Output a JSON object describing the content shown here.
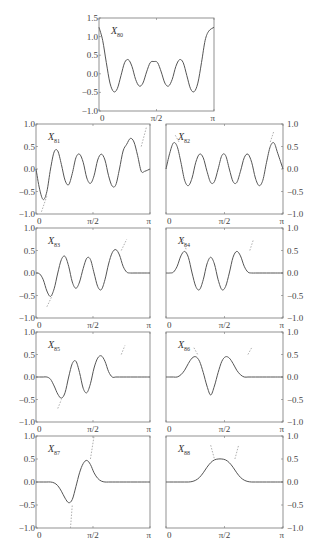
{
  "chart_data": [
    {
      "type": "line",
      "title": "X80",
      "label": "X",
      "subscript": "80",
      "xlim": [
        0,
        3.1416
      ],
      "ylim": [
        -1.0,
        1.5
      ],
      "xticks": [
        "0",
        "π/2",
        "π"
      ],
      "yticks": [
        "-1.0",
        "-0.5",
        "0.0",
        "0.5",
        "1.0",
        "1.5"
      ],
      "ytick_side": "left",
      "box": [
        99,
        18,
        214,
        111
      ],
      "x": [
        0,
        0.1,
        0.2,
        0.3,
        0.4,
        0.5,
        0.6,
        0.7,
        0.8,
        0.9,
        1.0,
        1.1,
        1.2,
        1.3,
        1.4,
        1.5,
        1.6,
        1.7,
        1.8,
        1.9,
        2.0,
        2.1,
        2.2,
        2.3,
        2.4,
        2.5,
        2.6,
        2.7,
        2.8,
        2.9,
        3.0,
        3.1416
      ],
      "solid": [
        1.25,
        0.9,
        0.3,
        -0.25,
        -0.48,
        -0.4,
        -0.05,
        0.3,
        0.38,
        0.2,
        -0.15,
        -0.33,
        -0.25,
        0.05,
        0.3,
        0.33,
        0.3,
        0.05,
        -0.25,
        -0.33,
        -0.15,
        0.2,
        0.38,
        0.3,
        -0.05,
        -0.4,
        -0.48,
        -0.25,
        0.3,
        0.9,
        1.15,
        1.25
      ],
      "dashed": []
    },
    {
      "type": "line",
      "title": "X81",
      "label": "X",
      "subscript": "81",
      "xlim": [
        0,
        3.1416
      ],
      "ylim": [
        -1.0,
        1.0
      ],
      "xticks": [
        "0",
        "π/2",
        "π"
      ],
      "yticks": [
        "-1.0",
        "-0.5",
        "0.0",
        "0.5",
        "1.0"
      ],
      "ytick_side": "left",
      "box": [
        36,
        124,
        150,
        214
      ],
      "x": [
        0,
        0.1,
        0.2,
        0.3,
        0.4,
        0.5,
        0.6,
        0.7,
        0.8,
        0.9,
        1.0,
        1.1,
        1.2,
        1.3,
        1.4,
        1.5,
        1.6,
        1.7,
        1.8,
        1.9,
        2.0,
        2.1,
        2.2,
        2.3,
        2.4,
        2.5,
        2.6,
        2.7,
        2.8,
        2.9,
        3.0,
        3.1416
      ],
      "solid": [
        0.0,
        -0.45,
        -0.68,
        -0.5,
        0.0,
        0.38,
        0.4,
        0.1,
        -0.25,
        -0.35,
        -0.1,
        0.25,
        0.33,
        0.15,
        -0.2,
        -0.32,
        -0.15,
        0.2,
        0.33,
        0.2,
        -0.15,
        -0.38,
        -0.35,
        0.0,
        0.4,
        0.55,
        0.68,
        0.6,
        0.3,
        -0.05,
        -0.05,
        0.0
      ],
      "dashed_points": [
        [
          0.15,
          -0.95
        ],
        [
          0.3,
          -0.6
        ]
      ],
      "dashed_points_right": [
        [
          2.9,
          0.5
        ],
        [
          3.05,
          0.95
        ]
      ]
    },
    {
      "type": "line",
      "title": "X82",
      "label": "X",
      "subscript": "82",
      "xlim": [
        0,
        3.1416
      ],
      "ylim": [
        -1.0,
        1.0
      ],
      "xticks": [
        "0",
        "π/2",
        "π"
      ],
      "yticks": [
        "-1.0",
        "-0.5",
        "0.0",
        "0.5",
        "1.0"
      ],
      "ytick_side": "right",
      "box": [
        166,
        124,
        283,
        214
      ],
      "x": [
        0,
        0.1,
        0.2,
        0.3,
        0.4,
        0.5,
        0.6,
        0.7,
        0.8,
        0.9,
        1.0,
        1.1,
        1.2,
        1.3,
        1.4,
        1.5,
        1.6,
        1.7,
        1.8,
        1.9,
        2.0,
        2.1,
        2.2,
        2.3,
        2.4,
        2.5,
        2.6,
        2.7,
        2.8,
        2.9,
        3.0,
        3.1416
      ],
      "solid": [
        0.0,
        0.35,
        0.58,
        0.5,
        0.15,
        -0.25,
        -0.37,
        -0.2,
        0.15,
        0.33,
        0.25,
        -0.05,
        -0.3,
        -0.28,
        0.0,
        0.3,
        0.3,
        0.0,
        -0.28,
        -0.3,
        -0.05,
        0.25,
        0.33,
        0.15,
        -0.2,
        -0.37,
        -0.25,
        0.15,
        0.5,
        0.58,
        0.35,
        0.0
      ],
      "dashed_points": [
        [
          0.25,
          0.75
        ],
        [
          0.35,
          0.6
        ]
      ],
      "dashed_points_right": [
        [
          2.8,
          0.6
        ],
        [
          2.9,
          0.85
        ]
      ]
    },
    {
      "type": "line",
      "title": "X83",
      "label": "X",
      "subscript": "83",
      "xlim": [
        0,
        3.1416
      ],
      "ylim": [
        -1.0,
        1.0
      ],
      "xticks": [
        "0",
        "π/2",
        "π"
      ],
      "yticks": [
        "-1.0",
        "-0.5",
        "0.0",
        "0.5",
        "1.0"
      ],
      "ytick_side": "left",
      "box": [
        36,
        228,
        150,
        318
      ],
      "x": [
        0,
        0.1,
        0.2,
        0.3,
        0.4,
        0.5,
        0.6,
        0.7,
        0.8,
        0.9,
        1.0,
        1.1,
        1.2,
        1.3,
        1.4,
        1.5,
        1.6,
        1.7,
        1.8,
        1.9,
        2.0,
        2.1,
        2.2,
        2.3,
        2.4,
        2.5,
        2.6,
        2.7,
        2.8,
        2.9,
        3.0,
        3.1416
      ],
      "solid": [
        0.0,
        -0.02,
        -0.15,
        -0.4,
        -0.52,
        -0.35,
        0.0,
        0.3,
        0.37,
        0.15,
        -0.2,
        -0.34,
        -0.2,
        0.1,
        0.33,
        0.3,
        0.0,
        -0.3,
        -0.37,
        -0.15,
        0.2,
        0.45,
        0.52,
        0.4,
        0.15,
        0.02,
        0.0,
        0.0,
        0.0,
        0.0,
        0.0,
        0.0
      ],
      "dashed_points": [
        [
          0.3,
          -0.75
        ],
        [
          0.45,
          -0.5
        ]
      ],
      "dashed_points_right": [
        [
          2.35,
          0.5
        ],
        [
          2.5,
          0.75
        ]
      ]
    },
    {
      "type": "line",
      "title": "X84",
      "label": "X",
      "subscript": "84",
      "xlim": [
        0,
        3.1416
      ],
      "ylim": [
        -1.0,
        1.0
      ],
      "xticks": [
        "0",
        "π/2",
        "π"
      ],
      "yticks": [
        "-1.0",
        "-0.5",
        "0.0",
        "0.5",
        "1.0"
      ],
      "ytick_side": "right",
      "box": [
        166,
        228,
        283,
        318
      ],
      "x": [
        0,
        0.1,
        0.2,
        0.3,
        0.4,
        0.5,
        0.6,
        0.7,
        0.8,
        0.9,
        1.0,
        1.1,
        1.2,
        1.3,
        1.4,
        1.5,
        1.6,
        1.7,
        1.8,
        1.9,
        2.0,
        2.1,
        2.2,
        2.3,
        2.4,
        2.5,
        2.6,
        2.7,
        2.8,
        2.9,
        3.0,
        3.1416
      ],
      "solid": [
        0.0,
        0.0,
        0.02,
        0.15,
        0.38,
        0.48,
        0.35,
        0.0,
        -0.3,
        -0.37,
        -0.15,
        0.2,
        0.35,
        0.2,
        -0.15,
        -0.37,
        -0.3,
        0.0,
        0.35,
        0.48,
        0.38,
        0.15,
        0.02,
        0.0,
        0.0,
        0.0,
        0.0,
        0.0,
        0.0,
        0.0,
        0.0,
        0.0
      ],
      "dashed_points": [
        [
          0.45,
          0.75
        ],
        [
          0.55,
          0.5
        ]
      ],
      "dashed_points_right": [
        [
          2.25,
          0.5
        ],
        [
          2.35,
          0.75
        ]
      ]
    },
    {
      "type": "line",
      "title": "X85",
      "label": "X",
      "subscript": "85",
      "xlim": [
        0,
        3.1416
      ],
      "ylim": [
        -1.0,
        1.0
      ],
      "xticks": [
        "0",
        "π/2",
        "π"
      ],
      "yticks": [
        "-1.0",
        "-0.5",
        "0.0",
        "0.5",
        "1.0"
      ],
      "ytick_side": "left",
      "box": [
        36,
        332,
        150,
        422
      ],
      "x": [
        0,
        0.1,
        0.2,
        0.3,
        0.4,
        0.5,
        0.6,
        0.7,
        0.8,
        0.9,
        1.0,
        1.1,
        1.2,
        1.3,
        1.4,
        1.5,
        1.6,
        1.7,
        1.8,
        1.9,
        2.0,
        2.1,
        2.2,
        2.3,
        2.4,
        2.5,
        2.6,
        2.7,
        2.8,
        2.9,
        3.0,
        3.1416
      ],
      "solid": [
        0.0,
        0.0,
        0.0,
        0.0,
        -0.05,
        -0.2,
        -0.38,
        -0.47,
        -0.35,
        0.0,
        0.3,
        0.35,
        0.1,
        -0.25,
        -0.35,
        -0.15,
        0.2,
        0.42,
        0.47,
        0.35,
        0.12,
        0.0,
        0.0,
        0.0,
        0.0,
        0.0,
        0.0,
        0.0,
        0.0,
        0.0,
        0.0,
        0.0
      ],
      "dashed_points": [
        [
          0.6,
          -0.7
        ],
        [
          0.7,
          -0.5
        ]
      ],
      "dashed_points_right": [
        [
          2.35,
          0.5
        ],
        [
          2.45,
          0.7
        ]
      ]
    },
    {
      "type": "line",
      "title": "X86",
      "label": "X",
      "subscript": "86",
      "xlim": [
        0,
        3.1416
      ],
      "ylim": [
        -1.0,
        1.0
      ],
      "xticks": [
        "0",
        "π/2",
        "π"
      ],
      "yticks": [
        "-1.0",
        "-0.5",
        "0.0",
        "0.5",
        "1.0"
      ],
      "ytick_side": "right",
      "box": [
        166,
        332,
        283,
        422
      ],
      "x": [
        0,
        0.1,
        0.2,
        0.3,
        0.4,
        0.5,
        0.6,
        0.7,
        0.8,
        0.9,
        1.0,
        1.1,
        1.2,
        1.3,
        1.4,
        1.5,
        1.6,
        1.7,
        1.8,
        1.9,
        2.0,
        2.1,
        2.2,
        2.3,
        2.4,
        2.5,
        2.6,
        2.7,
        2.8,
        2.9,
        3.0,
        3.1416
      ],
      "solid": [
        0.0,
        0.0,
        0.0,
        0.0,
        0.05,
        0.15,
        0.3,
        0.42,
        0.45,
        0.35,
        0.1,
        -0.2,
        -0.4,
        -0.2,
        0.1,
        0.35,
        0.45,
        0.42,
        0.3,
        0.15,
        0.05,
        0.0,
        0.0,
        0.0,
        0.0,
        0.0,
        0.0,
        0.0,
        0.0,
        0.0,
        0.0,
        0.0
      ],
      "dashed_points": [
        [
          0.75,
          0.65
        ],
        [
          0.85,
          0.5
        ]
      ],
      "dashed_points_right": [
        [
          2.2,
          0.5
        ],
        [
          2.3,
          0.65
        ]
      ]
    },
    {
      "type": "line",
      "title": "X87",
      "label": "X",
      "subscript": "87",
      "xlim": [
        0,
        3.1416
      ],
      "ylim": [
        -1.0,
        1.0
      ],
      "xticks": [
        "0",
        "π/2",
        "π"
      ],
      "yticks": [
        "-1.0",
        "-0.5",
        "0.0",
        "0.5",
        "1.0"
      ],
      "ytick_side": "left",
      "box": [
        36,
        436,
        150,
        528
      ],
      "x": [
        0,
        0.1,
        0.2,
        0.3,
        0.4,
        0.5,
        0.6,
        0.7,
        0.8,
        0.9,
        1.0,
        1.1,
        1.2,
        1.3,
        1.4,
        1.5,
        1.6,
        1.7,
        1.8,
        1.9,
        2.0,
        2.1,
        2.2,
        2.3,
        2.4,
        2.5,
        2.6,
        2.7,
        2.8,
        2.9,
        3.0,
        3.1416
      ],
      "solid": [
        0.0,
        0.0,
        0.0,
        0.0,
        0.0,
        -0.02,
        -0.08,
        -0.2,
        -0.35,
        -0.45,
        -0.38,
        -0.1,
        0.2,
        0.4,
        0.47,
        0.38,
        0.2,
        0.08,
        0.02,
        0.0,
        0.0,
        0.0,
        0.0,
        0.0,
        0.0,
        0.0,
        0.0,
        0.0,
        0.0,
        0.0,
        0.0,
        0.0
      ],
      "dashed_points": [
        [
          0.95,
          -1.0
        ],
        [
          1.0,
          -0.5
        ]
      ],
      "dashed_points_right": [
        [
          1.5,
          0.5
        ],
        [
          1.6,
          1.0
        ]
      ]
    },
    {
      "type": "line",
      "title": "X88",
      "label": "X",
      "subscript": "88",
      "xlim": [
        0,
        3.1416
      ],
      "ylim": [
        -1.0,
        1.0
      ],
      "xticks": [
        "0",
        "π/2",
        "π"
      ],
      "yticks": [
        "-1.0",
        "-0.5",
        "0.0",
        "0.5",
        "1.0"
      ],
      "ytick_side": "right",
      "box": [
        166,
        436,
        283,
        528
      ],
      "x": [
        0,
        0.1,
        0.2,
        0.3,
        0.4,
        0.5,
        0.6,
        0.7,
        0.8,
        0.9,
        1.0,
        1.1,
        1.2,
        1.3,
        1.4,
        1.5,
        1.6,
        1.7,
        1.8,
        1.9,
        2.0,
        2.1,
        2.2,
        2.3,
        2.4,
        2.5,
        2.6,
        2.7,
        2.8,
        2.9,
        3.0,
        3.1416
      ],
      "solid": [
        0.0,
        0.0,
        0.0,
        0.0,
        0.0,
        0.0,
        0.0,
        0.01,
        0.04,
        0.1,
        0.2,
        0.32,
        0.42,
        0.48,
        0.5,
        0.5,
        0.48,
        0.42,
        0.32,
        0.2,
        0.1,
        0.04,
        0.01,
        0.0,
        0.0,
        0.0,
        0.0,
        0.0,
        0.0,
        0.0,
        0.0,
        0.0
      ],
      "dashed_points": [
        [
          1.2,
          0.8
        ],
        [
          1.3,
          0.5
        ],
        [
          1.85,
          0.5
        ],
        [
          1.95,
          0.8
        ]
      ],
      "dashed_points_right": []
    }
  ]
}
